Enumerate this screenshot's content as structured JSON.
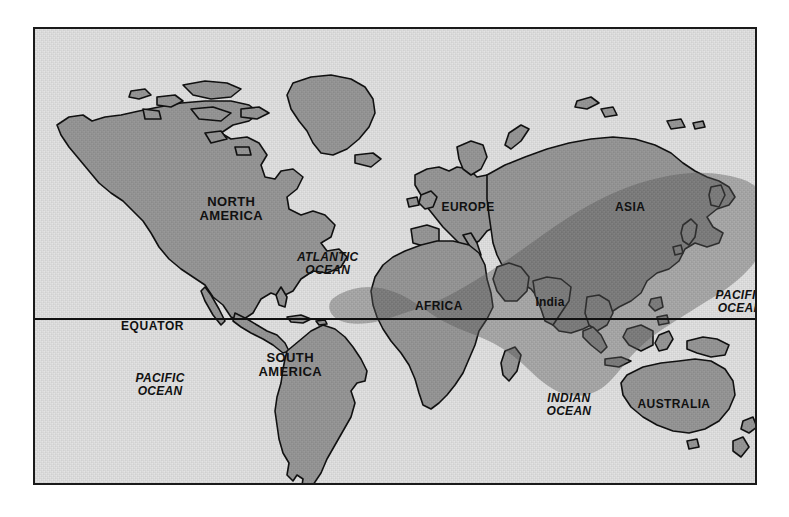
{
  "map": {
    "title": "World Map",
    "frame": {
      "border_color": "#1a1a1a",
      "background_color": "#e4e4e4"
    },
    "colors": {
      "ocean": "#e4e4e4",
      "land": "#9a9a9a",
      "land_outline": "#111111",
      "range_overlay": "#7e7e7e",
      "label_text": "#111111",
      "frame_border": "#1a1a1a",
      "equator_line": "#111111"
    },
    "equator": {
      "label": "EQUATOR",
      "label_x": 88,
      "label_y": 299,
      "line_y": 317
    },
    "labels": [
      {
        "name": "north-america",
        "text": "NORTH\nAMERICA",
        "kind": "continent",
        "x": 198,
        "y": 182,
        "size": 13
      },
      {
        "name": "south-america",
        "text": "SOUTH\nAMERICA",
        "kind": "continent",
        "x": 257,
        "y": 338,
        "size": 13
      },
      {
        "name": "europe",
        "text": "EUROPE",
        "kind": "continent",
        "x": 435,
        "y": 180,
        "size": 12
      },
      {
        "name": "asia",
        "text": "ASIA",
        "kind": "continent",
        "x": 597,
        "y": 180,
        "size": 12
      },
      {
        "name": "africa",
        "text": "AFRICA",
        "kind": "continent",
        "x": 406,
        "y": 279,
        "size": 12
      },
      {
        "name": "australia",
        "text": "AUSTRALIA",
        "kind": "continent",
        "x": 641,
        "y": 377,
        "size": 12
      },
      {
        "name": "india",
        "text": "India",
        "kind": "region",
        "x": 517,
        "y": 275,
        "size": 12
      },
      {
        "name": "atlantic-ocean",
        "text": "ATLANTIC\nOCEAN",
        "kind": "ocean",
        "x": 295,
        "y": 237,
        "size": 12
      },
      {
        "name": "pacific-ocean-west",
        "text": "PACIFIC\nOCEAN",
        "kind": "ocean",
        "x": 127,
        "y": 358,
        "size": 12
      },
      {
        "name": "pacific-ocean-east",
        "text": "PACIFIC\nOCEAN",
        "kind": "ocean",
        "x": 707,
        "y": 275,
        "size": 12
      },
      {
        "name": "indian-ocean",
        "text": "INDIAN\nOCEAN",
        "kind": "ocean",
        "x": 536,
        "y": 378,
        "size": 12
      }
    ]
  }
}
